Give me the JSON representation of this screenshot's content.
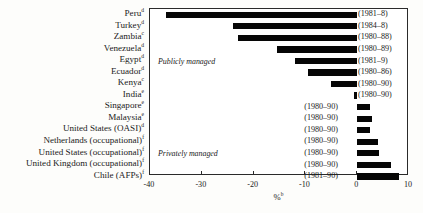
{
  "chart_data": {
    "type": "bar",
    "title": "",
    "xlabel": "%",
    "xlabel_sup": "b",
    "ylabel": "",
    "xlim": [
      -40,
      10
    ],
    "xticks": [
      -40,
      -30,
      -20,
      -10,
      0,
      10
    ],
    "xticklabels": [
      "-40",
      "-30",
      "-20",
      "-10",
      "0",
      "10"
    ],
    "grid": false,
    "orientation": "horizontal",
    "annotations": [
      {
        "text": "Publicly managed",
        "after_index": 4
      },
      {
        "text": "Privately managed",
        "after_index": 12
      }
    ],
    "categories": [
      "Peru",
      "Turkey",
      "Zambia",
      "Venezuela",
      "Egypt",
      "Ecuador",
      "Kenya",
      "India",
      "Singapore",
      "Malaysia",
      "United States (OASI)",
      "Netherlands (occupational)",
      "United States (occupational)",
      "United Kingdom (occupational)",
      "Chile (AFPs)"
    ],
    "category_superscripts": [
      "d",
      "d",
      "c",
      "d",
      "d",
      "d",
      "c",
      "e",
      "e",
      "e",
      "d",
      "f",
      "f",
      "f",
      "f"
    ],
    "values": [
      -37.0,
      -24.0,
      -23.0,
      -15.5,
      -12.0,
      -9.5,
      -5.0,
      -0.7,
      2.5,
      2.8,
      2.5,
      4.0,
      4.2,
      6.5,
      8.0
    ],
    "periods": [
      "(1981–8)",
      "(1984–8)",
      "(1980–88)",
      "(1980–89)",
      "(1981–9)",
      "(1980–86)",
      "(1980–90)",
      "(1980–90)",
      "(1980–90)",
      "(1980–90)",
      "(1980–90)",
      "(1980–90)",
      "(1980–90)",
      "(1980–90)",
      "(1981–90)"
    ]
  }
}
